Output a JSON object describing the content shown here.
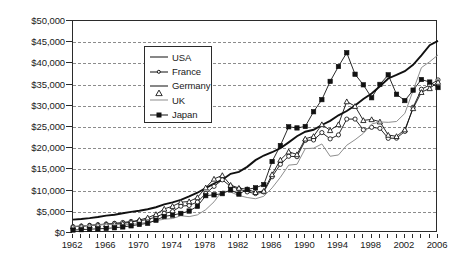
{
  "chart_data": {
    "type": "line",
    "title": "",
    "xlabel": "",
    "ylabel": "",
    "xlim": [
      1962,
      2006
    ],
    "ylim": [
      0,
      50000
    ],
    "grid": true,
    "legend_position": "upper-center",
    "y_ticks": [
      "$0",
      "$5,000",
      "$10,000",
      "$15,000",
      "$20,000",
      "$25,000",
      "$30,000",
      "$35,000",
      "$40,000",
      "$45,000",
      "$50,000"
    ],
    "y_tick_values": [
      0,
      5000,
      10000,
      15000,
      20000,
      25000,
      30000,
      35000,
      40000,
      45000,
      50000
    ],
    "x_ticks": [
      "1962",
      "1966",
      "1970",
      "1974",
      "1978",
      "1982",
      "1986",
      "1990",
      "1994",
      "1998",
      "2002",
      "2006"
    ],
    "x_tick_values": [
      1962,
      1966,
      1970,
      1974,
      1978,
      1982,
      1986,
      1990,
      1994,
      1998,
      2002,
      2006
    ],
    "x": [
      1962,
      1963,
      1964,
      1965,
      1966,
      1967,
      1968,
      1969,
      1970,
      1971,
      1972,
      1973,
      1974,
      1975,
      1976,
      1977,
      1978,
      1979,
      1980,
      1981,
      1982,
      1983,
      1984,
      1985,
      1986,
      1987,
      1988,
      1989,
      1990,
      1991,
      1992,
      1993,
      1994,
      1995,
      1996,
      1997,
      1998,
      1999,
      2000,
      2001,
      2002,
      2003,
      2004,
      2005,
      2006
    ],
    "series": [
      {
        "name": "USA",
        "marker": "none",
        "color": "#111111",
        "values": [
          3150,
          3300,
          3510,
          3770,
          4100,
          4300,
          4650,
          4980,
          5250,
          5600,
          6080,
          6740,
          7210,
          7800,
          8620,
          9500,
          10570,
          11680,
          12560,
          13960,
          14430,
          15600,
          17180,
          18270,
          19050,
          20000,
          21380,
          22810,
          23890,
          24340,
          25470,
          26460,
          27760,
          28780,
          30070,
          31590,
          32900,
          34600,
          36450,
          37270,
          38170,
          39680,
          41900,
          44300,
          45300
        ]
      },
      {
        "name": "France",
        "marker": "open-circle",
        "color": "#111111",
        "values": [
          1500,
          1640,
          1810,
          1960,
          2120,
          2290,
          2480,
          2720,
          2880,
          3200,
          3770,
          4620,
          5060,
          6330,
          6500,
          7310,
          9320,
          11000,
          12540,
          11000,
          10400,
          9700,
          9300,
          9680,
          13270,
          16200,
          18100,
          18000,
          21830,
          21940,
          23680,
          22200,
          23140,
          26860,
          26870,
          24340,
          24930,
          24680,
          22330,
          22370,
          23960,
          29660,
          33900,
          34900,
          36100
        ]
      },
      {
        "name": "Germany",
        "marker": "open-triangle",
        "color": "#111111",
        "values": [
          1490,
          1580,
          1740,
          1900,
          2040,
          2100,
          2240,
          2560,
          3060,
          3600,
          4400,
          5680,
          6320,
          7270,
          7430,
          8380,
          10690,
          12750,
          13600,
          11300,
          10600,
          10300,
          9600,
          9900,
          13810,
          17240,
          19170,
          18520,
          22220,
          22800,
          25600,
          24200,
          25600,
          31000,
          29900,
          26570,
          26780,
          26240,
          23110,
          22800,
          24380,
          29380,
          33200,
          34100,
          35600
        ]
      },
      {
        "name": "UK",
        "marker": "none",
        "color": "#8e8e8e",
        "values": [
          1560,
          1650,
          1790,
          1920,
          2050,
          2080,
          1900,
          2030,
          2280,
          2520,
          2920,
          3250,
          3410,
          4070,
          3860,
          4280,
          5500,
          7350,
          9940,
          9660,
          8830,
          8370,
          8080,
          8660,
          10630,
          13140,
          16000,
          16200,
          19900,
          20000,
          21000,
          18100,
          18400,
          20700,
          22000,
          23500,
          25700,
          26200,
          26100,
          26300,
          28200,
          33600,
          39000,
          40400,
          42000
        ]
      },
      {
        "name": "Japan",
        "marker": "solid-square",
        "color": "#111111",
        "values": [
          700,
          790,
          900,
          980,
          1080,
          1230,
          1430,
          1690,
          2010,
          2280,
          3010,
          3900,
          4230,
          4620,
          5180,
          6300,
          8810,
          9000,
          9280,
          10170,
          9180,
          10280,
          10650,
          11420,
          16860,
          20630,
          25050,
          24780,
          25120,
          28600,
          31450,
          35760,
          39270,
          42520,
          37440,
          34950,
          31900,
          35050,
          37300,
          32720,
          31230,
          33690,
          36200,
          35600,
          34300
        ]
      }
    ]
  },
  "legend": {
    "items": [
      {
        "label": "USA",
        "marker": "line"
      },
      {
        "label": "France",
        "marker": "open-circle"
      },
      {
        "label": "Germany",
        "marker": "open-triangle"
      },
      {
        "label": "UK",
        "marker": "gray-line"
      },
      {
        "label": "Japan",
        "marker": "solid-square"
      }
    ]
  },
  "colors": {
    "axis": "#2b2b2b",
    "gridline": "#8c8c8c",
    "text": "#1a1a1a",
    "usa": "#111111",
    "france": "#111111",
    "germany": "#111111",
    "uk": "#8e8e8e",
    "japan": "#111111",
    "background": "#ffffff"
  }
}
